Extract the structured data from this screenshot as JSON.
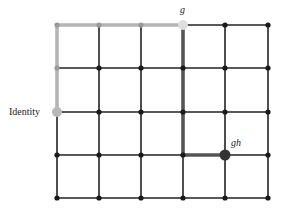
{
  "diagram": {
    "type": "grid-graph (Cayley graph of Z x Z)",
    "columns": 6,
    "rows": 5,
    "x_coords": [
      57,
      99,
      141,
      183,
      225,
      268
    ],
    "y_coords": [
      25,
      68,
      112,
      155,
      198
    ],
    "colors": {
      "grid_line": "#222222",
      "node": "#1a1a1a",
      "path_g": "#b5b5b5",
      "path_h": "#555555",
      "identity_node": "#b8b8b8",
      "g_node": "#dedede",
      "gh_node": "#333333"
    },
    "nodes": {
      "identity": {
        "label": "Identity",
        "col": 0,
        "row": 2
      },
      "g": {
        "label": "g",
        "col": 3,
        "row": 0
      },
      "gh": {
        "label": "gh",
        "col": 4,
        "row": 3
      }
    },
    "paths": [
      {
        "name": "path-g",
        "points": [
          [
            0,
            2
          ],
          [
            0,
            0
          ],
          [
            3,
            0
          ]
        ],
        "color": "#b5b5b5"
      },
      {
        "name": "path-h",
        "points": [
          [
            3,
            0
          ],
          [
            3,
            3
          ],
          [
            4,
            3
          ]
        ],
        "color": "#555555"
      }
    ]
  }
}
